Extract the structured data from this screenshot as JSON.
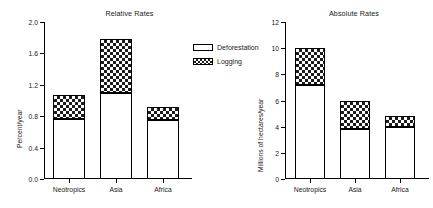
{
  "legend": {
    "position": "center",
    "entries": [
      {
        "label": "Deforestation",
        "swatch": "open-white-box"
      },
      {
        "label": "Logging",
        "swatch": "checkered-box"
      }
    ]
  },
  "chart_data": [
    {
      "type": "bar",
      "subtype": "stacked",
      "title": "Relative Rates",
      "xlabel": "",
      "ylabel": "Percent/year",
      "categories": [
        "Neotropics",
        "Asia",
        "Africa"
      ],
      "ylim": [
        0.0,
        2.0
      ],
      "yticks": [
        "0.0",
        "0.4",
        "0.8",
        "1.2",
        "1.6",
        "2.0"
      ],
      "ytick_values": [
        0.0,
        0.4,
        0.8,
        1.2,
        1.6,
        2.0
      ],
      "grid": false,
      "series": [
        {
          "name": "Deforestation",
          "values": [
            0.77,
            1.1,
            0.75
          ]
        },
        {
          "name": "Logging",
          "values": [
            0.3,
            0.69,
            0.17
          ]
        }
      ],
      "totals": [
        1.07,
        1.79,
        0.92
      ]
    },
    {
      "type": "bar",
      "subtype": "stacked",
      "title": "Absolute Rates",
      "xlabel": "",
      "ylabel": "Millions of hectares/year",
      "categories": [
        "Neotropics",
        "Asia",
        "Africa"
      ],
      "ylim": [
        0,
        12
      ],
      "yticks": [
        "0",
        "2",
        "4",
        "6",
        "8",
        "10",
        "12"
      ],
      "ytick_values": [
        0,
        2,
        4,
        6,
        8,
        10,
        12
      ],
      "grid": false,
      "series": [
        {
          "name": "Deforestation",
          "values": [
            7.2,
            3.8,
            4.0
          ]
        },
        {
          "name": "Logging",
          "values": [
            2.8,
            2.2,
            0.85
          ]
        }
      ],
      "totals": [
        10.0,
        6.0,
        4.85
      ]
    }
  ]
}
